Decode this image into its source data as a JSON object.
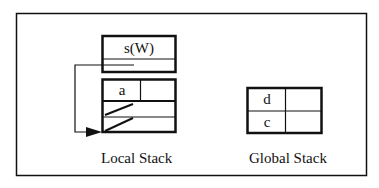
{
  "diagram": {
    "local_stack": {
      "label": "Local Stack",
      "top_frame": {
        "cells": [
          "s(W)"
        ]
      },
      "frame": {
        "cells": [
          "a"
        ]
      }
    },
    "global_stack": {
      "label": "Global Stack",
      "cells": [
        "d",
        "c"
      ]
    }
  }
}
